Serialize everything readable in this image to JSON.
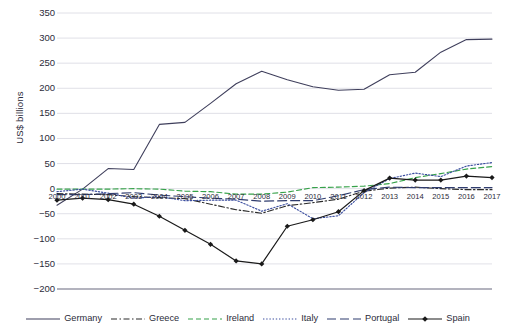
{
  "chart_data": {
    "type": "line",
    "title": "",
    "xlabel": "",
    "ylabel": "US$ billions",
    "ylim": [
      -200,
      350
    ],
    "yticks": [
      350,
      300,
      250,
      200,
      150,
      100,
      50,
      0,
      -50,
      -100,
      -150,
      -200
    ],
    "ytick_labels": [
      "350",
      "300",
      "250",
      "200",
      "150",
      "100",
      "50",
      "0",
      "−50",
      "−100",
      "−150",
      "−200"
    ],
    "grid": true,
    "legend_position": "bottom",
    "categories": [
      "2000",
      "2001",
      "2002",
      "2003",
      "2004",
      "2005",
      "2006",
      "2007",
      "2008",
      "2009",
      "2010",
      "2011",
      "2012",
      "2013",
      "2014",
      "2015",
      "2016",
      "2017"
    ],
    "series": [
      {
        "name": "Germany",
        "color": "#3f3f5c",
        "style": "solid",
        "marker": "none",
        "values": [
          -33,
          -1,
          40,
          38,
          128,
          132,
          170,
          209,
          234,
          217,
          203,
          196,
          198,
          227,
          232,
          272,
          297,
          298
        ]
      },
      {
        "name": "Greece",
        "color": "#2b2b2b",
        "style": "dashdot",
        "marker": "none",
        "values": [
          -10,
          -11,
          -12,
          -16,
          -18,
          -20,
          -31,
          -42,
          -49,
          -34,
          -28,
          -21,
          -5,
          1,
          3,
          0,
          -2,
          -2
        ]
      },
      {
        "name": "Ireland",
        "color": "#37a24a",
        "style": "dashed",
        "marker": "none",
        "values": [
          -1,
          -1,
          -1,
          0,
          -1,
          -5,
          -6,
          -11,
          -11,
          -7,
          2,
          3,
          5,
          10,
          22,
          30,
          39,
          44
        ]
      },
      {
        "name": "Italy",
        "color": "#3c4fa0",
        "style": "dotted",
        "marker": "none",
        "values": [
          -6,
          -1,
          -9,
          -19,
          -16,
          -24,
          -23,
          -23,
          -45,
          -30,
          -60,
          -54,
          -8,
          20,
          31,
          24,
          45,
          52
        ]
      },
      {
        "name": "Portugal",
        "color": "#2f3c6e",
        "style": "longdash",
        "marker": "none",
        "values": [
          -12,
          -12,
          -10,
          -8,
          -13,
          -16,
          -19,
          -21,
          -25,
          -24,
          -24,
          -14,
          -2,
          3,
          2,
          2,
          2,
          2
        ]
      },
      {
        "name": "Spain",
        "color": "#1a1a1a",
        "style": "solid",
        "marker": "diamond",
        "values": [
          -23,
          -19,
          -22,
          -31,
          -55,
          -83,
          -111,
          -144,
          -150,
          -75,
          -62,
          -46,
          -4,
          21,
          17,
          17,
          25,
          22
        ]
      }
    ]
  },
  "axis": {
    "y_title": "US$ billions"
  }
}
